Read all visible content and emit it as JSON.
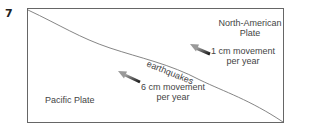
{
  "question_number": "7",
  "diagram": {
    "plates": {
      "north_american": {
        "line1": "North-American",
        "line2": "Plate"
      },
      "pacific": {
        "label": "Pacific Plate"
      }
    },
    "fault_label": "earthquakes",
    "movements": [
      {
        "plate": "North-American",
        "line1": "1 cm movement",
        "line2": "per year",
        "direction": "northwest"
      },
      {
        "plate": "Pacific",
        "line1": "6 cm movement",
        "line2": "per year",
        "direction": "northwest"
      }
    ],
    "colors": {
      "frame": "#666666",
      "fault": "#777777",
      "arrow_dark": "#222222",
      "arrow_light": "#999999",
      "text": "#444444"
    }
  }
}
